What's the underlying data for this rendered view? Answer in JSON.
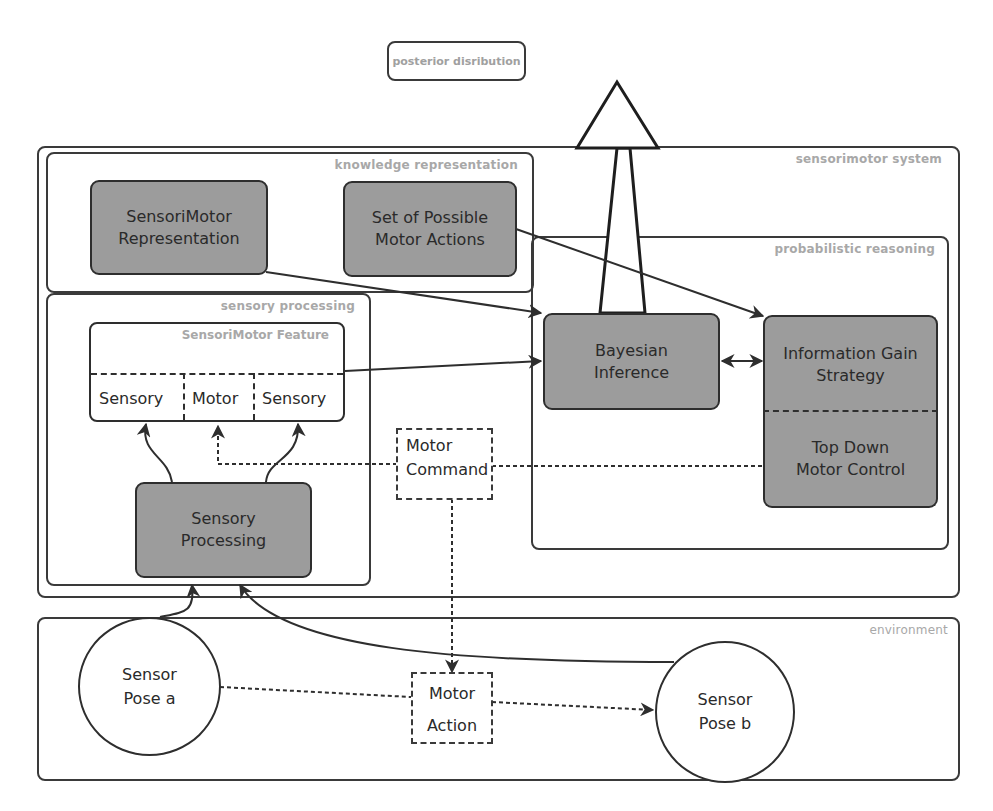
{
  "diagram": {
    "top_output": {
      "label": "posterior disribution"
    },
    "groups": {
      "sensorimotor_system": {
        "label": "sensorimotor system"
      },
      "knowledge_representation": {
        "label": "knowledge representation"
      },
      "sensory_processing": {
        "label": "sensory processing"
      },
      "probabilistic_reasoning": {
        "label": "probabilistic reasoning"
      },
      "environment": {
        "label": "environment"
      }
    },
    "nodes": {
      "sensorimotor_representation": {
        "line1": "SensoriMotor",
        "line2": "Representation"
      },
      "possible_motor_actions": {
        "line1": "Set of Possible",
        "line2": "Motor Actions"
      },
      "bayesian_inference": {
        "line1": "Bayesian",
        "line2": "Inference"
      },
      "information_gain_strategy": {
        "line1": "Information Gain",
        "line2": "Strategy"
      },
      "top_down_motor_control": {
        "line1": "Top Down",
        "line2": "Motor Control"
      },
      "sensory_processing": {
        "line1": "Sensory",
        "line2": "Processing"
      },
      "motor_command": {
        "line1": "Motor",
        "line2": "Command"
      },
      "motor_action": {
        "line1": "Motor",
        "line2": "Action"
      },
      "sensor_pose_a": {
        "line1": "Sensor",
        "line2": "Pose a"
      },
      "sensor_pose_b": {
        "line1": "Sensor",
        "line2": "Pose b"
      }
    },
    "feature": {
      "title": "SensoriMotor Feature",
      "cells": [
        "Sensory",
        "Motor",
        "Sensory"
      ]
    },
    "colors": {
      "node_fill": "#9c9c9c",
      "stroke": "#2e2e2e",
      "group_label": "#a8a8a8",
      "background": "#ffffff"
    }
  }
}
